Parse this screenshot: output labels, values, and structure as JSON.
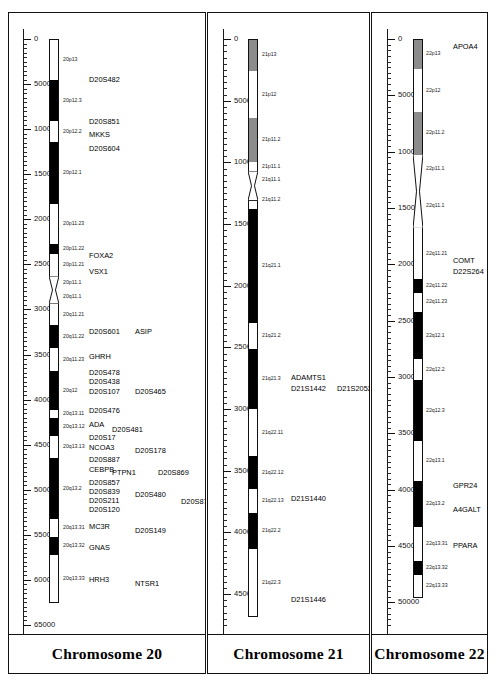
{
  "figure": {
    "width": 496,
    "height": 688,
    "background": "#ffffff",
    "line_color": "#111111"
  },
  "chart_data": {
    "type": "ideogram",
    "title": "",
    "ylabel": "",
    "axis_units": "kb",
    "axis_tick_interval_major": 5000,
    "axis_tick_interval_minor": 500,
    "colors": {
      "gneg": "#ffffff",
      "gpos": "#000000",
      "gvar": "#6f6f6f",
      "stalk": "#8c8c8c",
      "outline": "#111111"
    },
    "panels": [
      {
        "id": "chr20",
        "title": "Chromosome 20",
        "axis": {
          "min": 0,
          "max": 65000,
          "ticks": [
            0,
            5000,
            10000,
            15000,
            20000,
            25000,
            30000,
            35000,
            40000,
            45000,
            50000,
            55000,
            60000,
            65000
          ],
          "tick_labels": [
            "0",
            "5000",
            "10000",
            "15000",
            "20000",
            "25000",
            "30000",
            "35000",
            "40000",
            "45000",
            "50000",
            "55000",
            "60000",
            "65000"
          ]
        },
        "ideogram_start": 0,
        "ideogram_end": 62500,
        "centromere": {
          "start": 26300,
          "end": 29400
        },
        "bands": [
          {
            "label": "20p13",
            "start": 0,
            "end": 4600,
            "stain": "gneg"
          },
          {
            "label": "20p12.3",
            "start": 4600,
            "end": 9100,
            "stain": "gpos"
          },
          {
            "label": "20p12.2",
            "start": 9100,
            "end": 11400,
            "stain": "gneg"
          },
          {
            "label": "20p12.1",
            "start": 11400,
            "end": 18300,
            "stain": "gpos"
          },
          {
            "label": "20p11.23",
            "start": 18300,
            "end": 22700,
            "stain": "gneg"
          },
          {
            "label": "20p11.22",
            "start": 22700,
            "end": 23900,
            "stain": "gpos"
          },
          {
            "label": "20p11.21",
            "start": 23900,
            "end": 26300,
            "stain": "gneg"
          },
          {
            "label": "20p11.1",
            "start": 26300,
            "end": 27700,
            "stain": "gneg"
          },
          {
            "label": "20q11.1",
            "start": 27700,
            "end": 29400,
            "stain": "gneg"
          },
          {
            "label": "20q11.21",
            "start": 29400,
            "end": 31700,
            "stain": "gneg"
          },
          {
            "label": "20q11.22",
            "start": 31700,
            "end": 34300,
            "stain": "gpos"
          },
          {
            "label": "20q11.23",
            "start": 34300,
            "end": 36800,
            "stain": "gneg"
          },
          {
            "label": "20q12",
            "start": 36800,
            "end": 41200,
            "stain": "gpos"
          },
          {
            "label": "20q13.11",
            "start": 41200,
            "end": 42000,
            "stain": "gneg"
          },
          {
            "label": "20q13.12",
            "start": 42000,
            "end": 44000,
            "stain": "gpos"
          },
          {
            "label": "20q13.13",
            "start": 44000,
            "end": 46500,
            "stain": "gneg"
          },
          {
            "label": "20q13.2",
            "start": 46500,
            "end": 53200,
            "stain": "gpos"
          },
          {
            "label": "20q13.31",
            "start": 53200,
            "end": 55200,
            "stain": "gneg"
          },
          {
            "label": "20q13.32",
            "start": 55200,
            "end": 57200,
            "stain": "gpos"
          },
          {
            "label": "20q13.33",
            "start": 57200,
            "end": 62500,
            "stain": "gneg"
          }
        ],
        "markers": [
          {
            "label": "D20S482",
            "pos": 4600,
            "col": 0
          },
          {
            "label": "D20S851",
            "pos": 9200,
            "col": 0
          },
          {
            "label": "MKKS",
            "pos": 10700,
            "col": 0
          },
          {
            "label": "D20S604",
            "pos": 12200,
            "col": 0
          },
          {
            "label": "FOXA2",
            "pos": 24100,
            "col": 0
          },
          {
            "label": "VSX1",
            "pos": 25900,
            "col": 0
          },
          {
            "label": "D20S601",
            "pos": 32500,
            "col": 0
          },
          {
            "label": "ASIP",
            "pos": 32500,
            "col": 2
          },
          {
            "label": "GHRH",
            "pos": 35300,
            "col": 0
          },
          {
            "label": "D20S478",
            "pos": 37100,
            "col": 0
          },
          {
            "label": "D20S438",
            "pos": 38100,
            "col": 0
          },
          {
            "label": "D20S107",
            "pos": 39100,
            "col": 0
          },
          {
            "label": "D20S465",
            "pos": 39100,
            "col": 2
          },
          {
            "label": "D20S476",
            "pos": 41300,
            "col": 0
          },
          {
            "label": "ADA",
            "pos": 42800,
            "col": 0
          },
          {
            "label": "D20S481",
            "pos": 43400,
            "col": 1
          },
          {
            "label": "D20S17",
            "pos": 44300,
            "col": 0
          },
          {
            "label": "NCOA3",
            "pos": 45400,
            "col": 0
          },
          {
            "label": "D20S178",
            "pos": 45700,
            "col": 2
          },
          {
            "label": "D20S887",
            "pos": 46700,
            "col": 0
          },
          {
            "label": "CEBPB",
            "pos": 47800,
            "col": 0
          },
          {
            "label": "PTPN1",
            "pos": 48100,
            "col": 1
          },
          {
            "label": "D20S869",
            "pos": 48100,
            "col": 3
          },
          {
            "label": "D20S857",
            "pos": 49200,
            "col": 0
          },
          {
            "label": "D20S839",
            "pos": 50200,
            "col": 0
          },
          {
            "label": "D20S480",
            "pos": 50600,
            "col": 2
          },
          {
            "label": "D20S211",
            "pos": 51200,
            "col": 0
          },
          {
            "label": "D20S876",
            "pos": 51400,
            "col": 4
          },
          {
            "label": "D20S120",
            "pos": 52200,
            "col": 0
          },
          {
            "label": "MC3R",
            "pos": 54100,
            "col": 0
          },
          {
            "label": "D20S149",
            "pos": 54600,
            "col": 2
          },
          {
            "label": "GNAS",
            "pos": 56500,
            "col": 0
          },
          {
            "label": "HRH3",
            "pos": 60000,
            "col": 0
          },
          {
            "label": "NTSR1",
            "pos": 60500,
            "col": 2
          }
        ]
      },
      {
        "id": "chr21",
        "title": "Chromosome 21",
        "axis": {
          "min": 0,
          "max": 47500,
          "ticks": [
            0,
            5000,
            10000,
            15000,
            20000,
            25000,
            30000,
            35000,
            40000,
            45000
          ],
          "tick_labels": [
            "0",
            "5000",
            "10000",
            "15000",
            "20000",
            "25000",
            "30000",
            "35000",
            "40000",
            "45000"
          ]
        },
        "ideogram_start": 0,
        "ideogram_end": 46800,
        "centromere": {
          "start": 10700,
          "end": 13100
        },
        "bands": [
          {
            "label": "21p13",
            "start": 0,
            "end": 2600,
            "stain": "stalk"
          },
          {
            "label": "21p12",
            "start": 2600,
            "end": 6400,
            "stain": "gneg"
          },
          {
            "label": "21p11.2",
            "start": 6400,
            "end": 10000,
            "stain": "stalk"
          },
          {
            "label": "21p11.1",
            "start": 10000,
            "end": 10700,
            "stain": "gneg"
          },
          {
            "label": "21q11.1",
            "start": 10700,
            "end": 12200,
            "stain": "gneg"
          },
          {
            "label": "21q11.2",
            "start": 12200,
            "end": 13800,
            "stain": "gneg"
          },
          {
            "label": "21q21.1",
            "start": 13800,
            "end": 23000,
            "stain": "gpos"
          },
          {
            "label": "21q21.2",
            "start": 23000,
            "end": 25100,
            "stain": "gneg"
          },
          {
            "label": "21q21.3",
            "start": 25100,
            "end": 30000,
            "stain": "gpos"
          },
          {
            "label": "21q22.11",
            "start": 30000,
            "end": 33800,
            "stain": "gneg"
          },
          {
            "label": "21q22.12",
            "start": 33800,
            "end": 36500,
            "stain": "gpos"
          },
          {
            "label": "21q22.13",
            "start": 36500,
            "end": 38400,
            "stain": "gneg"
          },
          {
            "label": "21q22.2",
            "start": 38400,
            "end": 41300,
            "stain": "gpos"
          },
          {
            "label": "21q22.3",
            "start": 41300,
            "end": 46800,
            "stain": "gneg"
          }
        ],
        "markers": [
          {
            "label": "ADAMTS1",
            "pos": 27500,
            "col": 0
          },
          {
            "label": "D21S1442",
            "pos": 28400,
            "col": 0
          },
          {
            "label": "D21S2052",
            "pos": 28400,
            "col": 2
          },
          {
            "label": "D21S1440",
            "pos": 37300,
            "col": 0
          },
          {
            "label": "D21S1446",
            "pos": 45500,
            "col": 0
          }
        ]
      },
      {
        "id": "chr22",
        "title": "Chromosome 22",
        "axis": {
          "min": 0,
          "max": 52000,
          "ticks": [
            0,
            5000,
            10000,
            15000,
            20000,
            25000,
            30000,
            35000,
            40000,
            45000,
            50000
          ],
          "tick_labels": [
            "0",
            "5000",
            "10000",
            "15000",
            "20000",
            "25000",
            "30000",
            "35000",
            "40000",
            "45000",
            "50000"
          ]
        },
        "ideogram_start": 0,
        "ideogram_end": 49500,
        "centromere": {
          "start": 10200,
          "end": 16800
        },
        "bands": [
          {
            "label": "22p13",
            "start": 0,
            "end": 2700,
            "stain": "stalk"
          },
          {
            "label": "22p12",
            "start": 2700,
            "end": 6500,
            "stain": "gneg"
          },
          {
            "label": "22p11.2",
            "start": 6500,
            "end": 10200,
            "stain": "stalk"
          },
          {
            "label": "22p11.1",
            "start": 10200,
            "end": 12800,
            "stain": "gneg"
          },
          {
            "label": "22q11.1",
            "start": 12800,
            "end": 16800,
            "stain": "gneg"
          },
          {
            "label": "22q11.21",
            "start": 16800,
            "end": 21300,
            "stain": "gneg"
          },
          {
            "label": "22q11.22",
            "start": 21300,
            "end": 22500,
            "stain": "gpos"
          },
          {
            "label": "22q11.23",
            "start": 22500,
            "end": 24200,
            "stain": "gneg"
          },
          {
            "label": "22q12.1",
            "start": 24200,
            "end": 28400,
            "stain": "gpos"
          },
          {
            "label": "22q12.2",
            "start": 28400,
            "end": 30300,
            "stain": "gneg"
          },
          {
            "label": "22q12.3",
            "start": 30300,
            "end": 35700,
            "stain": "gpos"
          },
          {
            "label": "22q13.1",
            "start": 35700,
            "end": 39200,
            "stain": "gneg"
          },
          {
            "label": "22q13.2",
            "start": 39200,
            "end": 43300,
            "stain": "gpos"
          },
          {
            "label": "22q13.31",
            "start": 43300,
            "end": 46300,
            "stain": "gneg"
          },
          {
            "label": "22q13.32",
            "start": 46300,
            "end": 47600,
            "stain": "gpos"
          },
          {
            "label": "22q13.33",
            "start": 47600,
            "end": 49500,
            "stain": "gneg"
          }
        ],
        "markers": [
          {
            "label": "APOA4",
            "pos": 700,
            "col": 0
          },
          {
            "label": "COMT",
            "pos": 19700,
            "col": 0
          },
          {
            "label": "D22S264",
            "pos": 20700,
            "col": 0
          },
          {
            "label": "GPR24",
            "pos": 39700,
            "col": 0
          },
          {
            "label": "A4GALT",
            "pos": 41800,
            "col": 0
          },
          {
            "label": "PPARA",
            "pos": 45000,
            "col": 0
          }
        ]
      }
    ]
  }
}
